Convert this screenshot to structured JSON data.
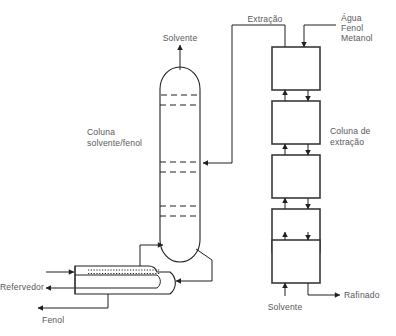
{
  "diagram": {
    "background_color": "#ffffff",
    "line_color": "#231f20",
    "box_stroke_color": "#3a3a3c",
    "text_color": "#58585b"
  },
  "labels": {
    "solvente_top": "Solvente",
    "extracao": "Extração",
    "feed_line_1": "Água",
    "feed_line_2": "Fenol",
    "feed_line_3": "Metanol",
    "coluna_solvente_fenol_line_1": "Coluna",
    "coluna_solvente_fenol_line_2": "solvente/fenol",
    "coluna_extracao_line_1": "Coluna de",
    "coluna_extracao_line_2": "extração",
    "refervedor": "Refervedor",
    "fenol_bottom": "Fenol",
    "solvente_bottom": "Solvente",
    "rafinado": "Rafinado"
  },
  "units": {
    "distillation_column": {
      "name": "Coluna solvente/fenol",
      "tray_sections": 3,
      "trays_per_section": 2
    },
    "extraction_column": {
      "name": "Coluna de extração",
      "stage_count": 5
    },
    "reboiler": {
      "name": "Refervedor",
      "type": "kettle"
    }
  },
  "streams": [
    {
      "name": "Solvente",
      "direction": "out",
      "location": "topo da coluna solvente/fenol"
    },
    {
      "name": "Extração",
      "direction": "in",
      "location": "topo da coluna de extração para coluna solvente/fenol"
    },
    {
      "name": "Água Fenol Metanol",
      "direction": "in",
      "location": "topo da coluna de extração"
    },
    {
      "name": "Rafinado",
      "direction": "out",
      "location": "fundo da coluna de extração"
    },
    {
      "name": "Solvente",
      "direction": "in",
      "location": "fundo da coluna de extração"
    },
    {
      "name": "Fenol",
      "direction": "out",
      "location": "fundo do refervedor"
    }
  ]
}
